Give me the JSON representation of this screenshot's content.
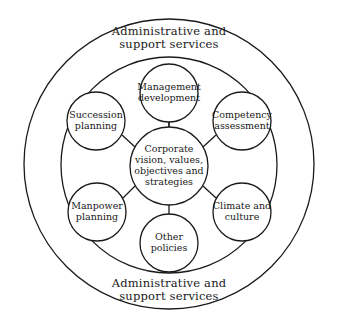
{
  "diagram": {
    "outer_ring_label_top": "Administrative and support services",
    "outer_ring_label_bottom": "Administrative and support services",
    "outer_top_line1": "Administrative and",
    "outer_top_line2": "support services",
    "outer_bottom_line1": "Administrative and",
    "outer_bottom_line2": "support services",
    "center": {
      "line1": "Corporate",
      "line2": "vision, values,",
      "line3": "objectives and",
      "line4": "strategies"
    },
    "nodes": [
      {
        "id": "management-development",
        "line1": "Management",
        "line2": "development"
      },
      {
        "id": "competency-assessment",
        "line1": "Competency",
        "line2": "assessment"
      },
      {
        "id": "climate-and-culture",
        "line1": "Climate and",
        "line2": "culture"
      },
      {
        "id": "other-policies",
        "line1": "Other",
        "line2": "policies"
      },
      {
        "id": "manpower-planning",
        "line1": "Manpower",
        "line2": "planning"
      },
      {
        "id": "succession-planning",
        "line1": "Succession",
        "line2": "planning"
      }
    ],
    "colors": {
      "stroke": "#1a1a1a",
      "background": "#ffffff"
    }
  }
}
